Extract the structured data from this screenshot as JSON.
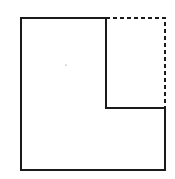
{
  "diagram": {
    "stroke_color": "#1a1a1a",
    "background": "#ffffff",
    "outer_square": {
      "x1": 21,
      "y1": 18,
      "x2": 165,
      "y2": 170
    },
    "inner_corner": {
      "x": 106,
      "y": 108
    },
    "center_dot": {
      "x": 66,
      "y": 65
    }
  }
}
